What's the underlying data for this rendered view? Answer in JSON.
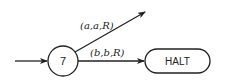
{
  "diagram": {
    "type": "turing-machine-state-diagram",
    "states": [
      {
        "id": "state-7",
        "label": "7",
        "shape": "circle"
      },
      {
        "id": "halt",
        "label": "HALT",
        "shape": "rounded-rectangle"
      }
    ],
    "edges": [
      {
        "from": "start",
        "to": "state-7",
        "label": ""
      },
      {
        "from": "state-7",
        "to": "unspecified",
        "label": "(a,a,R)"
      },
      {
        "from": "state-7",
        "to": "halt",
        "label": "(b,b,R)"
      }
    ],
    "colors": {
      "stroke": "#222222",
      "background": "#ffffff"
    }
  }
}
